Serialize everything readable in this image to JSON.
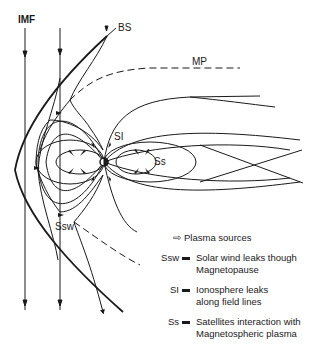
{
  "labels": {
    "imf": "IMF",
    "bs": "BS",
    "mp": "MP",
    "si": "SI",
    "ss": "Ss",
    "ssw": "Ssw"
  },
  "legend": {
    "items": [
      {
        "key": "",
        "symbol": "plasma-source-arrow",
        "text": "Plasma sources"
      },
      {
        "key": "Ssw",
        "text_lines": [
          "Solar wind leaks though",
          "Magnetopause"
        ]
      },
      {
        "key": "SI",
        "text_lines": [
          "Ionosphere leaks",
          "along field lines"
        ]
      },
      {
        "key": "Ss",
        "text_lines": [
          "Satellites interaction with",
          "Magnetospheric plasma"
        ]
      }
    ],
    "plasma_sources": "Plasma sources",
    "ssw_line1": "Solar wind leaks though",
    "ssw_line2": "Magnetopause",
    "si_line1": "Ionosphere leaks",
    "si_line2": "along field lines",
    "ss_line1": "Satellites interaction with",
    "ss_line2": "Magnetospheric plasma"
  },
  "colors": {
    "ink": "#1a1a1a",
    "background": "#ffffff"
  }
}
